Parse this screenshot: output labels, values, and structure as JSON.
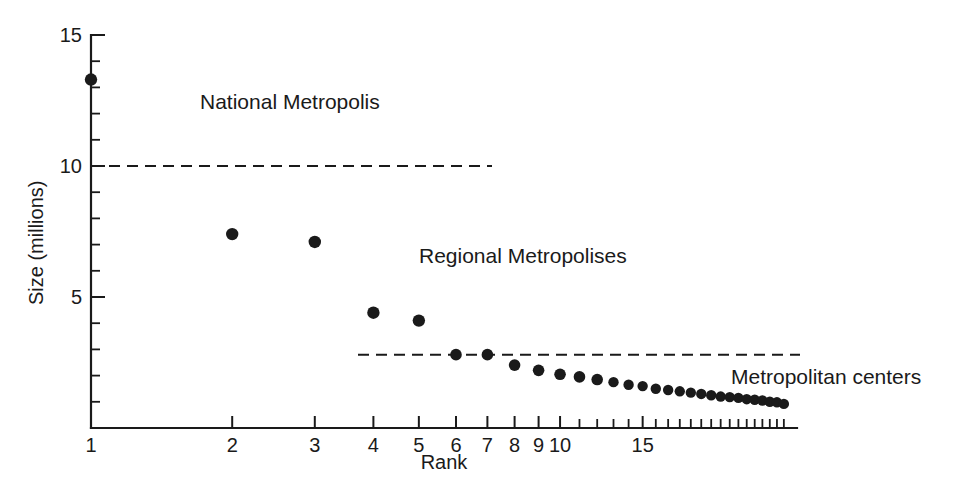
{
  "chart_data": {
    "type": "scatter",
    "title": "",
    "xlabel": "Rank",
    "ylabel": "Size (millions)",
    "x_scale": "log",
    "y_scale": "linear",
    "xlim": [
      1,
      32
    ],
    "ylim": [
      0,
      15
    ],
    "grid": false,
    "legend": "none",
    "x_tick_labels": [
      "1",
      "2",
      "3",
      "4",
      "5",
      "6",
      "7",
      "8",
      "9",
      "10",
      "15"
    ],
    "x_tick_values": [
      1,
      2,
      3,
      4,
      5,
      6,
      7,
      8,
      9,
      10,
      15
    ],
    "x_minor_ticks": [
      11,
      12,
      13,
      14,
      16,
      17,
      18,
      19,
      20,
      21,
      22,
      23,
      24,
      25,
      26,
      27,
      28,
      29,
      30
    ],
    "y_tick_labels": [
      "5",
      "10",
      "15"
    ],
    "y_tick_values": [
      5,
      10,
      15
    ],
    "y_minor_ticks": [
      1,
      2,
      3,
      4,
      6,
      7,
      8,
      9,
      11,
      12,
      13,
      14
    ],
    "x": [
      1,
      2,
      3,
      4,
      5,
      6,
      7,
      8,
      9,
      10,
      11,
      12,
      13,
      14,
      15,
      16,
      17,
      18,
      19,
      20,
      21,
      22,
      23,
      24,
      25,
      26,
      27,
      28,
      29,
      30
    ],
    "values": [
      13.3,
      7.4,
      7.1,
      4.4,
      4.1,
      2.8,
      2.8,
      2.4,
      2.2,
      2.05,
      1.95,
      1.85,
      1.75,
      1.65,
      1.6,
      1.5,
      1.45,
      1.4,
      1.35,
      1.3,
      1.25,
      1.2,
      1.18,
      1.15,
      1.1,
      1.08,
      1.05,
      1.0,
      0.98,
      0.92
    ],
    "marker": "filled-circle",
    "marker_color": "#1a1a1a",
    "annotations": [
      {
        "text": "National Metropolis",
        "x_px": 200,
        "y_px": 109,
        "anchor": "start"
      },
      {
        "text": "Regional Metropolises",
        "x_px": 419,
        "y_px": 263,
        "anchor": "start"
      },
      {
        "text": "Metropolitan centers",
        "x_px": 731,
        "y_px": 384,
        "anchor": "start"
      }
    ],
    "threshold_lines": [
      {
        "name": "national-metropolis-threshold",
        "y_value": 10,
        "x_start_px": 91,
        "x_end_px": 492
      },
      {
        "name": "regional-metropolis-threshold",
        "y_value": 2.8,
        "x_start_px": 358,
        "x_end_px": 800
      }
    ]
  },
  "axes": {
    "y_label": "Size (millions)",
    "x_label": "Rank"
  }
}
